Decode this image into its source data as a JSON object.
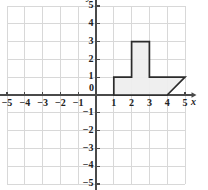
{
  "figure": {
    "axes": {
      "x_label": "x",
      "y_label": "y",
      "origin_label": "0",
      "x_min": -5,
      "x_max": 5,
      "y_min": -5,
      "y_max": 5,
      "x_ticks": [
        "-5",
        "-4",
        "-3",
        "-2",
        "-1",
        "1",
        "2",
        "3",
        "4",
        "5"
      ],
      "y_ticks": [
        "-5",
        "-4",
        "-3",
        "-2",
        "-1",
        "1",
        "2",
        "3",
        "4",
        "5"
      ],
      "grid": true,
      "grid_step": 1
    },
    "colors": {
      "grid": "#d8d8d8",
      "axis": "#4a4a4a",
      "shape_fill": "#eeeeee",
      "shape_stroke": "#2b2b2b",
      "text": "#222222",
      "background": "#ffffff"
    }
  },
  "chart_data": {
    "type": "scatter",
    "title": "",
    "xlabel": "x",
    "ylabel": "y",
    "xlim": [
      -5,
      5
    ],
    "ylim": [
      -5,
      5
    ],
    "grid": true,
    "legend": "none",
    "annotations": [],
    "shapes": [
      {
        "name": "shaded-polygon",
        "kind": "polygon",
        "closed": true,
        "fill": "#eeeeee",
        "stroke": "#2b2b2b",
        "vertices": [
          [
            1,
            0
          ],
          [
            1,
            1
          ],
          [
            2,
            1
          ],
          [
            2,
            3
          ],
          [
            3,
            3
          ],
          [
            3,
            1
          ],
          [
            5,
            1
          ],
          [
            4,
            0
          ]
        ]
      }
    ]
  }
}
